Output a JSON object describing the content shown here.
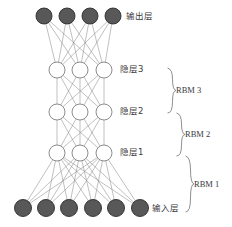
{
  "figure": {
    "background": "#ffffff",
    "edge_color": "#8c8c8c",
    "visible_node_fill": "#585858",
    "visible_node_stroke": "#2b2b2b",
    "hidden_node_fill": "#ffffff",
    "hidden_node_stroke": "#6f6f6f",
    "text_color": "#3a3a3a"
  },
  "layers": [
    {
      "id": "output",
      "label": "输出层",
      "type": "visible",
      "node_count": 4,
      "y": 16,
      "radius": 8,
      "node_x": [
        44,
        67,
        90,
        113
      ],
      "label_x": 126,
      "label_y": 12
    },
    {
      "id": "hidden3",
      "label": "隐层3",
      "type": "hidden",
      "node_count": 3,
      "y": 70,
      "radius": 8,
      "node_x": [
        57,
        80,
        104
      ],
      "label_x": 120,
      "label_y": 65
    },
    {
      "id": "hidden2",
      "label": "隐层2",
      "type": "hidden",
      "node_count": 3,
      "y": 112,
      "radius": 8,
      "node_x": [
        57,
        80,
        104
      ],
      "label_x": 120,
      "label_y": 107
    },
    {
      "id": "hidden1",
      "label": "隐层1",
      "type": "hidden",
      "node_count": 3,
      "y": 153,
      "radius": 8,
      "node_x": [
        57,
        80,
        104
      ],
      "label_x": 120,
      "label_y": 148
    },
    {
      "id": "input",
      "label": "输入层",
      "type": "visible",
      "node_count": 6,
      "y": 208,
      "radius": 8.5,
      "node_x": [
        23,
        46,
        69,
        93,
        116,
        140
      ],
      "label_x": 152,
      "label_y": 204
    }
  ],
  "connections": [
    {
      "from": "hidden3",
      "to": "output"
    },
    {
      "from": "hidden2",
      "to": "hidden3"
    },
    {
      "from": "hidden1",
      "to": "hidden2"
    },
    {
      "from": "input",
      "to": "hidden1"
    }
  ],
  "braces": [
    {
      "id": "rbm3",
      "label": "RBM 3",
      "brace_x": 168,
      "top_y": 68,
      "bottom_y": 113,
      "label_x": 176,
      "label_y": 86
    },
    {
      "id": "rbm2",
      "label": "RBM 2",
      "brace_x": 177,
      "top_y": 113,
      "bottom_y": 156,
      "label_x": 185,
      "label_y": 130
    },
    {
      "id": "rbm1",
      "label": "RBM 1",
      "brace_x": 186,
      "top_y": 156,
      "bottom_y": 212,
      "label_x": 194,
      "label_y": 180
    }
  ]
}
